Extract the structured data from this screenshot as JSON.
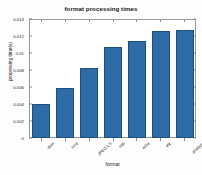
{
  "chart_data": {
    "type": "bar",
    "title": "format processing times",
    "xlabel": "format",
    "ylabel": "processing time(s)",
    "categories": [
      "dcm",
      "nrrd",
      "JPEG-LS",
      "nifti",
      "mha",
      "vtk",
      "analyze"
    ],
    "values": [
      0.004,
      0.0058,
      0.0082,
      0.0107,
      0.0114,
      0.0125,
      0.0126
    ],
    "ylim": [
      0,
      0.014
    ],
    "yticks": [
      0,
      0.002,
      0.004,
      0.006,
      0.008,
      0.01,
      0.012,
      0.014
    ],
    "ytick_labels": [
      "0",
      "0.002",
      "0.004",
      "0.006",
      "0.008",
      "0.01",
      "0.012",
      "0.014"
    ],
    "grid": false,
    "legend": null,
    "bar_color": "#2e6ca8",
    "bar_edge_color": "#1d4e7d",
    "axes_color": "#9a9a9a",
    "background": "#ffffff"
  }
}
